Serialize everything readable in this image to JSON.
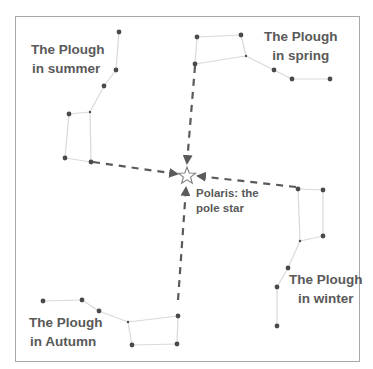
{
  "colors": {
    "frame": "#a8a8a8",
    "star": "#4a4a4a",
    "constellation_line": "#d9d9d9",
    "arrow": "#5a5a5a",
    "text": "#595959",
    "polaris_stroke": "#7f7f7f"
  },
  "labels": {
    "summer": {
      "line1": "The Plough",
      "line2": "in summer"
    },
    "spring": {
      "line1": "The Plough",
      "line2": "in spring"
    },
    "winter": {
      "line1": "The Plough",
      "line2": "in winter"
    },
    "autumn": {
      "line1": "The Plough",
      "line2": "in Autumn"
    },
    "polaris": {
      "line1": "Polaris: the",
      "line2": "pole star"
    }
  },
  "polaris": {
    "icon": "star-outline-icon",
    "x": 187,
    "y": 176
  },
  "constellations": {
    "summer": {
      "stars": [
        [
          119,
          32
        ],
        [
          116,
          70
        ],
        [
          104,
          86
        ],
        [
          90,
          112,
          "small"
        ],
        [
          69,
          114
        ],
        [
          65,
          158
        ],
        [
          91,
          162
        ]
      ],
      "lines": [
        [
          0,
          1
        ],
        [
          1,
          2
        ],
        [
          2,
          3
        ],
        [
          3,
          4
        ],
        [
          4,
          5
        ],
        [
          5,
          6
        ],
        [
          6,
          3
        ]
      ]
    },
    "spring": {
      "stars": [
        [
          197,
          37
        ],
        [
          241,
          35
        ],
        [
          246,
          56,
          "small"
        ],
        [
          195,
          64
        ],
        [
          274,
          70
        ],
        [
          292,
          79
        ],
        [
          330,
          79
        ]
      ],
      "lines": [
        [
          0,
          1
        ],
        [
          1,
          2
        ],
        [
          2,
          3
        ],
        [
          3,
          0
        ],
        [
          2,
          4
        ],
        [
          4,
          5
        ],
        [
          5,
          6
        ]
      ]
    },
    "winter": {
      "stars": [
        [
          298,
          189
        ],
        [
          323,
          190
        ],
        [
          323,
          236
        ],
        [
          300,
          241,
          "small"
        ],
        [
          288,
          268
        ],
        [
          277,
          287
        ],
        [
          277,
          326
        ]
      ],
      "lines": [
        [
          0,
          1
        ],
        [
          1,
          2
        ],
        [
          2,
          3
        ],
        [
          3,
          0
        ],
        [
          3,
          4
        ],
        [
          4,
          5
        ],
        [
          5,
          6
        ]
      ]
    },
    "autumn": {
      "stars": [
        [
          43,
          301
        ],
        [
          82,
          300
        ],
        [
          99,
          311
        ],
        [
          128,
          322,
          "small"
        ],
        [
          178,
          316
        ],
        [
          177,
          344
        ],
        [
          132,
          345
        ]
      ],
      "lines": [
        [
          0,
          1
        ],
        [
          1,
          2
        ],
        [
          2,
          3
        ],
        [
          3,
          4
        ],
        [
          4,
          5
        ],
        [
          5,
          6
        ],
        [
          6,
          3
        ]
      ]
    }
  },
  "arrows": [
    {
      "name": "arrow-from-spring",
      "from": [
        195,
        66
      ],
      "to": [
        187,
        163
      ]
    },
    {
      "name": "arrow-from-summer",
      "from": [
        93,
        162
      ],
      "to": [
        177,
        174
      ]
    },
    {
      "name": "arrow-from-winter",
      "from": [
        296,
        187
      ],
      "to": [
        198,
        176
      ]
    },
    {
      "name": "arrow-from-autumn",
      "from": [
        178,
        300
      ],
      "to": [
        186,
        188
      ]
    }
  ]
}
